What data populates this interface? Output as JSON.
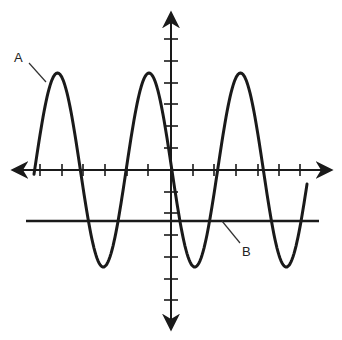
{
  "figure": {
    "labels": {
      "A": "A",
      "B": "B"
    },
    "caption": ""
  },
  "colors": {
    "ink": "#1a1a1a",
    "background": "#ffffff"
  },
  "chart_data": {
    "type": "line",
    "title": "",
    "xlabel": "",
    "ylabel": "",
    "grid": false,
    "axes": {
      "x_ticks_each_side": 6,
      "y_ticks_each_side": 6,
      "arrows_on_both_ends": true
    },
    "series": [
      {
        "name": "A",
        "kind": "sine wave",
        "cycles_visible": 3,
        "amplitude_ticks": 4.5,
        "offset_ticks": 0,
        "peaks_x_ticks": [
          -5.3,
          -1.0,
          3.2
        ],
        "troughs_x_ticks": [
          -3.2,
          1.0,
          5.3
        ]
      },
      {
        "name": "B",
        "kind": "horizontal line",
        "y_ticks": -2.3
      }
    ]
  }
}
